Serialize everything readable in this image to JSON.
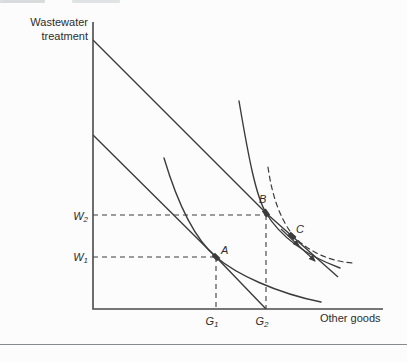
{
  "figure": {
    "colors": {
      "ink": "#3c3c3c",
      "axis": "#4a4a4a",
      "text": "#2d2d2d",
      "separator": "#868b8f",
      "background": "#fcfcfc"
    },
    "y_axis_title_lines": [
      "Wastewater",
      "treatment"
    ],
    "x_axis_title": "Other goods",
    "axis_tick_labels": {
      "w2": {
        "base": "W",
        "sub": "2"
      },
      "w1": {
        "base": "W",
        "sub": "1"
      },
      "g1": {
        "base": "G",
        "sub": "1"
      },
      "g2": {
        "base": "G",
        "sub": "2"
      }
    },
    "point_labels": [
      "A",
      "B",
      "C"
    ],
    "geometry": {
      "axes": {
        "points": [
          [
            93,
            22
          ],
          [
            93,
            309
          ],
          [
            383,
            309
          ]
        ]
      },
      "budget_lines": [
        {
          "name": "budget-line-outer",
          "points": [
            [
              93,
              40
            ],
            [
              266,
              213
            ],
            [
              338,
              277
            ]
          ]
        },
        {
          "name": "budget-line-inner",
          "points": [
            [
              93,
              135
            ],
            [
              216,
              257
            ],
            [
              266,
              309
            ]
          ]
        }
      ],
      "indifference_curves": [
        {
          "name": "indifference-curve-1",
          "dashed": false,
          "d": "M164,158 C178,205 196,240 216,257 C236,274 276,293 321,302"
        },
        {
          "name": "indifference-curve-2",
          "dashed": false,
          "d": "M239,101 C249,160 256,196 266,213 C280,236 305,255 340,268"
        },
        {
          "name": "indifference-curve-dashed",
          "dashed": true,
          "d": "M268,167 C272,196 280,218 292,234 C307,252 332,262 354,263"
        }
      ],
      "movement_arrow_segments": [
        {
          "x1": 281,
          "y1": 229,
          "x2": 299,
          "y2": 246
        },
        {
          "x1": 299,
          "y1": 246,
          "x2": 315,
          "y2": 261
        }
      ],
      "guides": [
        {
          "name": "guide-w2-horizontal",
          "x1": 93,
          "y1": 215,
          "x2": 266,
          "y2": 215
        },
        {
          "name": "guide-w1-horizontal",
          "x1": 93,
          "y1": 257,
          "x2": 216,
          "y2": 257
        },
        {
          "name": "guide-g1-vertical",
          "x1": 216,
          "y1": 257,
          "x2": 216,
          "y2": 309
        },
        {
          "name": "guide-g2-vertical",
          "x1": 266,
          "y1": 215,
          "x2": 266,
          "y2": 309
        }
      ],
      "points": [
        {
          "name": "point-a",
          "x": 216,
          "y": 257,
          "angle": 44
        },
        {
          "name": "point-b",
          "x": 266,
          "y": 213,
          "angle": 55
        },
        {
          "name": "point-c",
          "x": 292,
          "y": 236,
          "angle": 42
        }
      ],
      "texts": [
        {
          "name": "y-axis-title-line-1",
          "bind": "figure.y_axis_title_lines.0",
          "x": 88,
          "y": 26,
          "anchor": "end",
          "italic": false,
          "size": 11
        },
        {
          "name": "y-axis-title-line-2",
          "bind": "figure.y_axis_title_lines.1",
          "x": 88,
          "y": 40,
          "anchor": "end",
          "italic": false,
          "size": 11
        },
        {
          "name": "x-axis-title",
          "bind": "figure.x_axis_title",
          "x": 320,
          "y": 322,
          "anchor": "start",
          "italic": false,
          "size": 11
        },
        {
          "name": "point-label-a",
          "bind": "figure.point_labels.0",
          "x": 221,
          "y": 254,
          "anchor": "start",
          "italic": true,
          "size": 11
        },
        {
          "name": "point-label-b",
          "bind": "figure.point_labels.1",
          "x": 259,
          "y": 203,
          "anchor": "start",
          "italic": true,
          "size": 11
        },
        {
          "name": "point-label-c",
          "bind": "figure.point_labels.2",
          "x": 296,
          "y": 233,
          "anchor": "start",
          "italic": true,
          "size": 11
        }
      ],
      "sub_texts": [
        {
          "name": "tick-label-w2",
          "base_bind": "figure.axis_tick_labels.w2.base",
          "sub_bind": "figure.axis_tick_labels.w2.sub",
          "x": 88,
          "y": 220,
          "anchor": "end"
        },
        {
          "name": "tick-label-w1",
          "base_bind": "figure.axis_tick_labels.w1.base",
          "sub_bind": "figure.axis_tick_labels.w1.sub",
          "x": 88,
          "y": 261,
          "anchor": "end"
        },
        {
          "name": "tick-label-g1",
          "base_bind": "figure.axis_tick_labels.g1.base",
          "sub_bind": "figure.axis_tick_labels.g1.sub",
          "x": 212,
          "y": 325,
          "anchor": "middle"
        },
        {
          "name": "tick-label-g2",
          "base_bind": "figure.axis_tick_labels.g2.base",
          "sub_bind": "figure.axis_tick_labels.g2.sub",
          "x": 262,
          "y": 325,
          "anchor": "middle"
        }
      ]
    }
  },
  "chart_data": {
    "type": "line",
    "title": "",
    "xlabel": "Other goods",
    "ylabel": "Wastewater treatment",
    "legend": "none",
    "grid": false,
    "series_description": [
      {
        "name": "inner budget line",
        "style": "solid straight",
        "note": "from y-axis to x-axis at G2, tangent to indifference curve 1 at point A"
      },
      {
        "name": "outer budget line",
        "style": "solid straight",
        "note": "parallel to inner line, higher intercept, tangent to indifference curve 2 at point B, passes through point C"
      },
      {
        "name": "indifference curve 1",
        "style": "solid convex",
        "note": "tangent at A"
      },
      {
        "name": "indifference curve 2",
        "style": "solid convex",
        "note": "tangent at B"
      },
      {
        "name": "indifference curve 3",
        "style": "dashed convex",
        "note": "passes near B through C, flattens to the right"
      },
      {
        "name": "movement arrow",
        "style": "arrowheads along outer budget line",
        "note": "from B toward C and beyond"
      }
    ],
    "points": [
      {
        "name": "A",
        "x_label": "G1",
        "y_label": "W1"
      },
      {
        "name": "B",
        "x_label": "G2",
        "y_label": "W2"
      },
      {
        "name": "C",
        "x_label": "",
        "y_label": ""
      }
    ],
    "guides": [
      "dashed horizontal at W2 to B",
      "dashed horizontal at W1 to A",
      "dashed vertical at G1 to A",
      "dashed vertical at G2 to B"
    ]
  }
}
